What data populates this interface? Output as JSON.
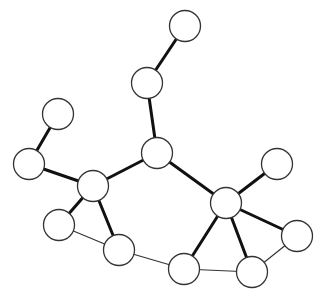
{
  "diagram": {
    "type": "undirected-graph",
    "canvas": {
      "width": 321,
      "height": 297,
      "background": "#ffffff"
    },
    "node_radius": 15.5,
    "colors": {
      "node_fill": "#ffffff",
      "node_stroke": "#333333",
      "edge_thick": "#111111",
      "edge_thin": "#333333"
    },
    "nodes": [
      {
        "id": "n1",
        "x": 185,
        "y": 26
      },
      {
        "id": "n2",
        "x": 147,
        "y": 83
      },
      {
        "id": "n3",
        "x": 58,
        "y": 114
      },
      {
        "id": "n4",
        "x": 29,
        "y": 164
      },
      {
        "id": "n5",
        "x": 157,
        "y": 153
      },
      {
        "id": "n6",
        "x": 93,
        "y": 186
      },
      {
        "id": "n7",
        "x": 277,
        "y": 164
      },
      {
        "id": "n8",
        "x": 226,
        "y": 203
      },
      {
        "id": "n9",
        "x": 59,
        "y": 225
      },
      {
        "id": "n10",
        "x": 297,
        "y": 236
      },
      {
        "id": "n11",
        "x": 119,
        "y": 250
      },
      {
        "id": "n12",
        "x": 184,
        "y": 269
      },
      {
        "id": "n13",
        "x": 252,
        "y": 272
      }
    ],
    "edges": [
      {
        "from": "n1",
        "to": "n2",
        "weight": "thick"
      },
      {
        "from": "n2",
        "to": "n5",
        "weight": "thick"
      },
      {
        "from": "n3",
        "to": "n4",
        "weight": "thick"
      },
      {
        "from": "n4",
        "to": "n6",
        "weight": "thick"
      },
      {
        "from": "n6",
        "to": "n5",
        "weight": "thick"
      },
      {
        "from": "n5",
        "to": "n8",
        "weight": "thick"
      },
      {
        "from": "n6",
        "to": "n9",
        "weight": "thick"
      },
      {
        "from": "n6",
        "to": "n11",
        "weight": "thick"
      },
      {
        "from": "n8",
        "to": "n7",
        "weight": "thick"
      },
      {
        "from": "n8",
        "to": "n10",
        "weight": "thick"
      },
      {
        "from": "n8",
        "to": "n12",
        "weight": "thick"
      },
      {
        "from": "n8",
        "to": "n13",
        "weight": "thick"
      },
      {
        "from": "n9",
        "to": "n11",
        "weight": "thin"
      },
      {
        "from": "n11",
        "to": "n12",
        "weight": "thin"
      },
      {
        "from": "n12",
        "to": "n13",
        "weight": "thin"
      },
      {
        "from": "n13",
        "to": "n10",
        "weight": "thin"
      }
    ]
  }
}
